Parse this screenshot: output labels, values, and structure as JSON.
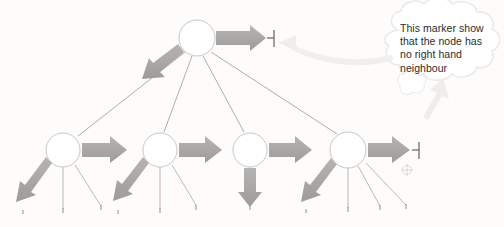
{
  "figure": {
    "type": "tree-diagram",
    "background_color": "#fdfcfb"
  },
  "callout": {
    "shape": "thought-cloud",
    "lines": [
      "This marker show",
      "that the node has",
      "no right hand",
      "neighbour"
    ],
    "full_text": "This marker shows that the node has no right hand neighbour",
    "text_color": "#2c2c2c",
    "outline_color": "#eceae8"
  },
  "colors": {
    "node_stroke": "#c9c7c5",
    "node_fill": "#ffffff",
    "edge_line": "#8d8b89",
    "arrow_gray": "#a9a7a5",
    "arrow_pale": "#efeeec",
    "marker_dark": "#6f6d6b",
    "registration_mark": "#d8d6d4"
  },
  "nodes": [
    {
      "id": "root",
      "label": "",
      "cx": 197,
      "cy": 38,
      "r": 18,
      "level": 0
    },
    {
      "id": "child1",
      "label": "",
      "cx": 63,
      "cy": 150,
      "r": 17,
      "level": 1
    },
    {
      "id": "child2",
      "label": "",
      "cx": 160,
      "cy": 150,
      "r": 17,
      "level": 1
    },
    {
      "id": "child3",
      "label": "",
      "cx": 250,
      "cy": 150,
      "r": 17,
      "level": 1
    },
    {
      "id": "child4",
      "label": "",
      "cx": 348,
      "cy": 150,
      "r": 18,
      "level": 1
    }
  ],
  "edges": [
    {
      "from": "root",
      "to": "child1"
    },
    {
      "from": "root",
      "to": "child2"
    },
    {
      "from": "root",
      "to": "child3"
    },
    {
      "from": "root",
      "to": "child4"
    }
  ],
  "arrows": {
    "sibling_right": [
      {
        "node": "root",
        "direction": "right",
        "terminated": true
      },
      {
        "node": "child1",
        "direction": "right",
        "terminated": false
      },
      {
        "node": "child2",
        "direction": "right",
        "terminated": false
      },
      {
        "node": "child3",
        "direction": "right",
        "terminated": false
      },
      {
        "node": "child4",
        "direction": "right",
        "terminated": true
      }
    ],
    "child_down": [
      {
        "node": "root",
        "direction": "down-left"
      },
      {
        "node": "child1",
        "direction": "down-left"
      },
      {
        "node": "child2",
        "direction": "down-left"
      },
      {
        "node": "child3",
        "direction": "down"
      },
      {
        "node": "child4",
        "direction": "down-left"
      }
    ]
  },
  "end_markers": [
    {
      "for": "root",
      "x": 272,
      "y": 38,
      "symbol": "right-terminator"
    },
    {
      "for": "child4",
      "x": 418,
      "y": 150,
      "symbol": "right-terminator"
    }
  ],
  "registration_mark": {
    "x": 407,
    "y": 170,
    "symbol": "crosshair-circle"
  },
  "callout_pointers": [
    {
      "from": "cloud-left",
      "to": "root-end-marker",
      "style": "curved-pale-arrow"
    },
    {
      "from": "cloud-bottom",
      "to": "child4-end-marker",
      "style": "straight-pale-arrow"
    }
  ]
}
